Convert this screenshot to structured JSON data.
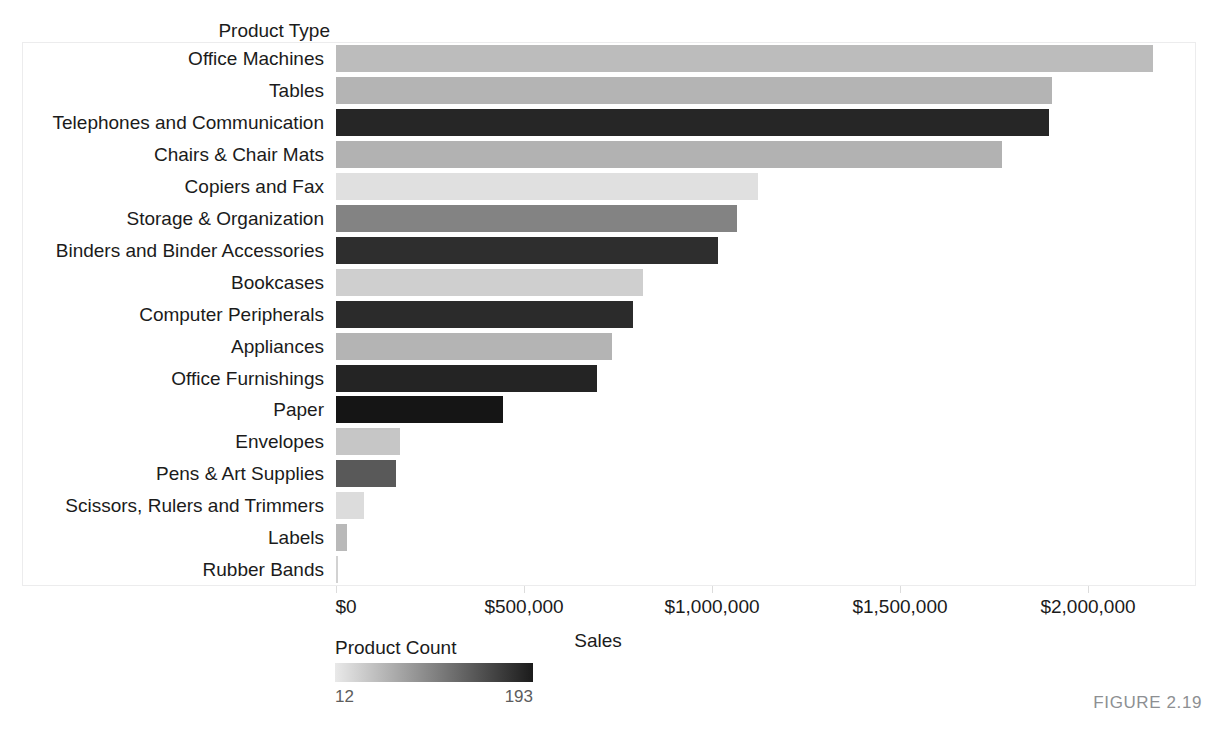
{
  "figure": {
    "caption": "FIGURE 2.19"
  },
  "axes": {
    "y_title": "Product Type",
    "x_title": "Sales",
    "x_ticks": [
      "$0",
      "$500,000",
      "$1,000,000",
      "$1,500,000",
      "$2,000,000"
    ]
  },
  "legend": {
    "title": "Product Count",
    "min_label": "12",
    "max_label": "193",
    "gradient_start": "#e9e9e9",
    "gradient_end": "#1b1b1b"
  },
  "chart_data": {
    "type": "bar",
    "orientation": "horizontal",
    "title": "",
    "xlabel": "Sales",
    "ylabel": "Product Type",
    "xlim": [
      0,
      2300000
    ],
    "grid": false,
    "legend_position": "bottom-left",
    "color_encoding": {
      "field": "Product Count",
      "min": 12,
      "max": 193,
      "scale": "sequential-gray-light-to-dark"
    },
    "x_tick_values": [
      0,
      500000,
      1000000,
      1500000,
      2000000
    ],
    "x_tick_labels": [
      "$0",
      "$500,000",
      "$1,000,000",
      "$1,500,000",
      "$2,000,000"
    ],
    "categories": [
      "Office Machines",
      "Tables",
      "Telephones and Communication",
      "Chairs & Chair Mats",
      "Copiers and Fax",
      "Storage & Organization",
      "Binders and Binder Accessories",
      "Bookcases",
      "Computer Peripherals",
      "Appliances",
      "Office Furnishings",
      "Paper",
      "Envelopes",
      "Pens & Art Supplies",
      "Scissors, Rulers and Trimmers",
      "Labels",
      "Rubber Bands"
    ],
    "values": [
      2173000,
      1904000,
      1896000,
      1771000,
      1123000,
      1066000,
      1016000,
      816000,
      790000,
      734000,
      694000,
      444000,
      170000,
      160000,
      74000,
      29000,
      5000
    ],
    "bar_colors": [
      "#bcbcbc",
      "#b4b4b4",
      "#262626",
      "#b2b2b2",
      "#e0e0e0",
      "#838383",
      "#2e2e2e",
      "#cfcfcf",
      "#2b2b2b",
      "#b4b4b4",
      "#242424",
      "#151515",
      "#c6c6c6",
      "#595959",
      "#dcdcdc",
      "#b9b9b9",
      "#d2d2d2"
    ]
  }
}
